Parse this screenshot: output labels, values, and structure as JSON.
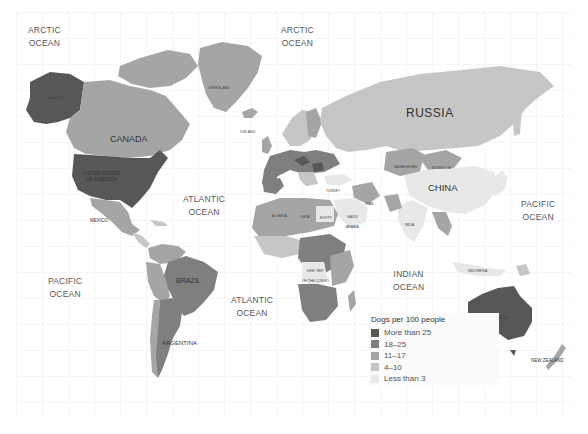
{
  "legend": {
    "title": "Dogs per 100 people",
    "items": [
      {
        "label": "More than 25",
        "color": "#575757"
      },
      {
        "label": "18–25",
        "color": "#7f7f7f"
      },
      {
        "label": "11–17",
        "color": "#a5a5a5"
      },
      {
        "label": "4–10",
        "color": "#c6c6c6"
      },
      {
        "label": "Less than 3",
        "color": "#e8e8e8"
      }
    ]
  },
  "oceans": {
    "arctic_left": "ARCTIC\nOCEAN",
    "arctic_right": "ARCTIC\nOCEAN",
    "atlantic_north": "ATLANTIC\nOCEAN",
    "atlantic_south": "ATLANTIC\nOCEAN",
    "pacific_left": "PACIFIC\nOCEAN",
    "pacific_right": "PACIFIC\nOCEAN",
    "indian": "INDIAN\nOCEAN"
  },
  "countries": {
    "russia": "RUSSIA",
    "china": "CHINA",
    "canada": "CANADA",
    "usa": "UNITED STATES\nOF AMERICA",
    "brazil": "BRAZIL",
    "argentina": "ARGENTINA",
    "australia": "AUSTRALIA",
    "greenland": "GREENLAND",
    "alaska": "ALASKA",
    "mexico": "MEXICO",
    "india": "INDIA",
    "indonesia": "INDONESIA",
    "new_zealand": "NEW ZEALAND",
    "kazakhstan": "KAZAKHSTAN",
    "mongolia": "MONGOLIA",
    "iceland": "ICELAND",
    "turkey": "TURKEY",
    "iran": "IRAN",
    "algeria": "ALGERIA",
    "libya": "LIBYA",
    "egypt": "EGYPT",
    "saudi_arabia": "SAUDI\nARABIA",
    "sudan": "SUDAN",
    "mali": "MALI",
    "niger": "NIGER",
    "chad": "CHAD",
    "drc": "DEM. REP.\nOF THE CONGO",
    "angola": "ANGOLA",
    "south_africa": "SOUTH AFRICA",
    "mauritania": "MAURITANIA",
    "ethiopia": "ETHIOPIA",
    "tanzania": "TANZANIA",
    "namibia": "NAMIBIA",
    "madagascar": "MADAGASCAR",
    "bolivia": "BOLIVIA",
    "peru": "PERU",
    "colombia": "COLOMBIA",
    "venezuela": "VENEZUELA",
    "japan": "JAPAN",
    "philippines": "PHILIPPINES",
    "finland": "FINLAND",
    "sweden": "SWEDEN",
    "norway": "NORWAY"
  },
  "map_colors": {
    "grid": "#ececec",
    "background": "#ffffff",
    "more_than_25": "#575757",
    "18_25": "#7f7f7f",
    "11_17": "#a5a5a5",
    "4_10": "#c6c6c6",
    "less_than_3": "#e8e8e8"
  }
}
